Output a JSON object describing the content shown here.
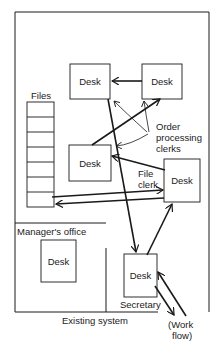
{
  "diagram": {
    "title": "Existing system",
    "files_label": "Files",
    "file_drawers": 7,
    "manager_office_label": "Manager's office",
    "desks": [
      {
        "id": "order-clerk-1",
        "label": "Desk"
      },
      {
        "id": "order-clerk-2",
        "label": "Desk"
      },
      {
        "id": "order-clerk-3",
        "label": "Desk"
      },
      {
        "id": "file-clerk",
        "label": "Desk"
      },
      {
        "id": "manager",
        "label": "Desk"
      },
      {
        "id": "secretary",
        "label": "Desk"
      }
    ],
    "annotations": {
      "order_processing_line1": "Order",
      "order_processing_line2": "processing",
      "order_processing_line3": "clerks",
      "file_clerk_line1": "File",
      "file_clerk_line2": "clerk",
      "secretary": "Secretary",
      "work_flow_line1": "(Work",
      "work_flow_line2": "flow)"
    },
    "colors": {
      "line": "#1a1a1a",
      "background": "#ffffff"
    }
  }
}
